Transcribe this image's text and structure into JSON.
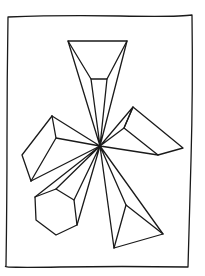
{
  "drawing": {
    "description": "Hand-drawn line sketch of geometric solids radiating from a central point inside a rectangular frame",
    "stroke_color": "#1a1a1a",
    "background": "#ffffff",
    "center": [
      100,
      146
    ],
    "frame": [
      [
        8,
        17
      ],
      [
        192,
        15
      ],
      [
        188,
        267
      ],
      [
        6,
        266
      ]
    ],
    "shapes": [
      {
        "name": "top-truncated-pyramid",
        "outer": [
          [
            68,
            41
          ],
          [
            127,
            41
          ]
        ],
        "inner": [
          [
            91,
            79
          ],
          [
            107,
            79
          ]
        ]
      },
      {
        "name": "right-wedge",
        "points": [
          [
            133,
            107
          ],
          [
            124,
            128
          ],
          [
            183,
            148
          ],
          [
            158,
            155
          ]
        ]
      },
      {
        "name": "left-prism",
        "points": [
          [
            52,
            116
          ],
          [
            56,
            138
          ],
          [
            22,
            155
          ],
          [
            31,
            181
          ]
        ]
      },
      {
        "name": "hexagonal-prism",
        "points": [
          [
            35,
            197
          ],
          [
            56,
            189
          ],
          [
            74,
            200
          ],
          [
            77,
            225
          ],
          [
            56,
            235
          ],
          [
            36,
            220
          ]
        ]
      },
      {
        "name": "bottom-pyramid",
        "points": [
          [
            126,
            205
          ],
          [
            163,
            234
          ],
          [
            114,
            248
          ]
        ]
      }
    ]
  }
}
